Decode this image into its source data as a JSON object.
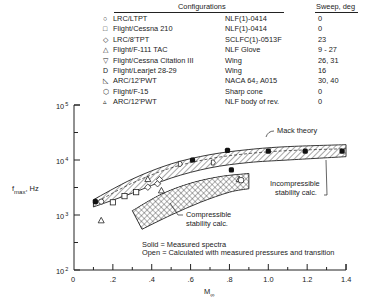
{
  "legend_table": {
    "header_configurations": "Configurations",
    "header_sweep": "Sweep, deg",
    "rows": [
      {
        "symbol": "circle",
        "glyph": "○",
        "facility": "LRC/LTPT",
        "model": "NLF(1)-0414",
        "sweep": "0"
      },
      {
        "symbol": "square",
        "glyph": "□",
        "facility": "Flight/Cessna 210",
        "model": "NLF(1)-0414",
        "sweep": "0"
      },
      {
        "symbol": "diamond",
        "glyph": "◇",
        "facility": "LRC/8'TPT",
        "model": "SCLFC(1)-0513F",
        "sweep": "23"
      },
      {
        "symbol": "triangle",
        "glyph": "△",
        "facility": "Flight/F-111 TAC",
        "model": "NLF Glove",
        "sweep": "9 - 27"
      },
      {
        "symbol": "inverted-pentagon",
        "glyph": "▽",
        "facility": "Flight/Cessna Citation III",
        "model": "Wing",
        "sweep": "26, 31"
      },
      {
        "symbol": "d-shape",
        "glyph": "D",
        "facility": "Flight/Learjet 28-29",
        "model": "Wing",
        "sweep": "16"
      },
      {
        "symbol": "right-triangle",
        "glyph": "◺",
        "facility": "ARC/12'PWT",
        "model": "NACA 64₂ A015",
        "sweep": "30, 40"
      },
      {
        "symbol": "octagon",
        "glyph": "⬡",
        "facility": "Flight/F-15",
        "model": "Sharp cone",
        "sweep": "0"
      },
      {
        "symbol": "small-triangle",
        "glyph": "▵",
        "facility": "ARC/12'PWT",
        "model": "NLF body of rev.",
        "sweep": "0"
      }
    ]
  },
  "chart_data": {
    "type": "scatter",
    "title": "",
    "xlabel": "M∞",
    "ylabel": "fmax, Hz",
    "ylabel_main": "f",
    "ylabel_sub": "max",
    "ylabel_unit": ", Hz",
    "xlabel_main": "M",
    "xlabel_sub": "∞",
    "xlim": [
      0,
      1.4
    ],
    "ylim": [
      100,
      100000
    ],
    "yscale": "log",
    "x_ticks": [
      "0",
      ".2",
      ".4",
      ".6",
      ".8",
      "1.0",
      "1.2",
      "1.4"
    ],
    "y_ticks": [
      {
        "base": "10",
        "exp": "5"
      },
      {
        "base": "10",
        "exp": "4"
      },
      {
        "base": "10",
        "exp": "3"
      },
      {
        "base": "10",
        "exp": "2"
      }
    ],
    "bands": [
      {
        "name": "Incompressible stability calc.",
        "pattern": "diagonal-hatch",
        "upper": [
          [
            0.1,
            1900
          ],
          [
            0.3,
            4500
          ],
          [
            0.5,
            8500
          ],
          [
            0.7,
            12500
          ],
          [
            0.9,
            15500
          ],
          [
            1.1,
            17500
          ],
          [
            1.4,
            19000
          ]
        ],
        "lower": [
          [
            0.1,
            1400
          ],
          [
            0.3,
            2500
          ],
          [
            0.5,
            4700
          ],
          [
            0.7,
            7200
          ],
          [
            0.9,
            9000
          ],
          [
            1.1,
            10000
          ],
          [
            1.4,
            11500
          ]
        ]
      },
      {
        "name": "Compressible stability calc.",
        "pattern": "cross-hatch",
        "upper": [
          [
            0.3,
            1200
          ],
          [
            0.45,
            2400
          ],
          [
            0.6,
            3800
          ],
          [
            0.75,
            5000
          ],
          [
            0.9,
            5700
          ]
        ],
        "lower": [
          [
            0.35,
            550
          ],
          [
            0.5,
            1000
          ],
          [
            0.65,
            1700
          ],
          [
            0.8,
            2600
          ],
          [
            0.9,
            3000
          ]
        ]
      }
    ],
    "annotations": [
      {
        "text": "Mack theory"
      },
      {
        "text": "Incompressible stability calc."
      },
      {
        "text": "Compressible stability calc."
      }
    ],
    "notes": [
      "Solid = Measured spectra",
      "Open = Calculated with measured pressures and transition"
    ],
    "series": [
      {
        "name": "Measured spectra (solid)",
        "points": [
          [
            0.11,
            1750
          ],
          [
            0.61,
            10000
          ],
          [
            0.79,
            15000
          ],
          [
            0.81,
            6600
          ],
          [
            1.0,
            14500
          ],
          [
            1.19,
            14500
          ],
          [
            1.38,
            14500
          ]
        ]
      },
      {
        "name": "LRC/LTPT (circle)",
        "points": [
          [
            0.14,
            1750
          ]
        ]
      },
      {
        "name": "Flight/Cessna 210 (square)",
        "points": [
          [
            0.2,
            1700
          ],
          [
            0.26,
            2200
          ],
          [
            0.32,
            2600
          ]
        ]
      },
      {
        "name": "LRC/8'TPT (diamond)",
        "points": [
          [
            0.38,
            3200
          ],
          [
            0.43,
            3700
          ],
          [
            0.44,
            4400
          ]
        ]
      },
      {
        "name": "Flight/F-111 TAC (triangle)",
        "points": [
          [
            0.38,
            4500
          ],
          [
            0.45,
            2800
          ],
          [
            0.85,
            4500
          ]
        ]
      },
      {
        "name": "ARC/12'PWT body (small triangle)",
        "points": [
          [
            0.14,
            800
          ]
        ]
      },
      {
        "name": "Flight/Learjet (d-shape)",
        "points": [
          [
            0.55,
            8500
          ],
          [
            0.72,
            9000
          ]
        ]
      },
      {
        "name": "Flight/F-15 (octagon)",
        "points": [
          [
            0.86,
            4300
          ]
        ]
      }
    ]
  }
}
